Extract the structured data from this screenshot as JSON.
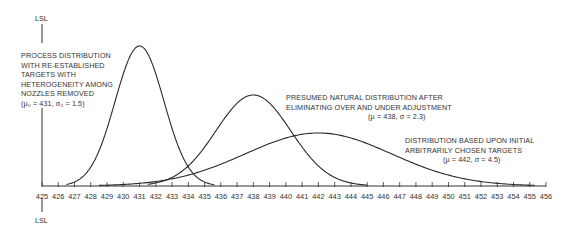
{
  "chart_data": {
    "type": "line",
    "title": "",
    "xlabel": "",
    "ylabel": "",
    "xlim": [
      425,
      456
    ],
    "x_ticks": [
      425,
      426,
      427,
      428,
      429,
      430,
      431,
      432,
      433,
      434,
      435,
      436,
      437,
      438,
      439,
      440,
      441,
      442,
      443,
      444,
      445,
      446,
      447,
      448,
      449,
      450,
      451,
      452,
      453,
      454,
      455,
      456
    ],
    "grid": false,
    "legend": "none (inline annotations)",
    "reference_lines": [
      {
        "name": "LSL",
        "x": 425,
        "label": "LSL"
      }
    ],
    "series": [
      {
        "name": "Process distribution with re-established targets with heterogeneity among nozzles removed",
        "distribution": "normal",
        "mean": 431,
        "sigma": 1.5,
        "param_label": "(μ₀ = 431, σ₀ = 1.5)",
        "x_range": [
          426.5,
          435.6
        ],
        "relative_peak": 1.0
      },
      {
        "name": "Presumed natural distribution after eliminating over and under adjustment",
        "distribution": "normal",
        "mean": 438,
        "sigma": 2.3,
        "param_label": "(μ = 438, σ = 2.3)",
        "x_range": [
          431.5,
          445
        ],
        "relative_peak": 0.65
      },
      {
        "name": "Distribution based upon initial arbitrarily chosen targets",
        "distribution": "normal",
        "mean": 442,
        "sigma": 4.5,
        "param_label": "(μ = 442, σ = 4.5)",
        "x_range": [
          428.5,
          455.3
        ],
        "relative_peak": 0.38
      }
    ],
    "annotations": [
      {
        "lines": [
          "PROCESS DISTRIBUTION",
          "WITH RE-ESTABLISHED",
          "TARGETS WITH",
          "HETEROGENEITY AMONG",
          "NOZZLES REMOVED",
          "(μ₀ = 431, σ₀ = 1.5)"
        ]
      },
      {
        "lines": [
          "PRESUMED NATURAL DISTRIBUTION AFTER",
          "ELIMINATING OVER AND UNDER ADJUSTMENT",
          "(μ = 438, σ = 2.3)"
        ]
      },
      {
        "lines": [
          "DISTRIBUTION BASED UPON INITIAL",
          "ARBITRARILY CHOSEN TARGETS",
          "(μ = 442, σ = 4.5)"
        ]
      }
    ]
  },
  "labels": {
    "lsl_top": "LSL",
    "lsl_bottom": "LSL",
    "a1": {
      "l1": "PROCESS DISTRIBUTION",
      "l2": "WITH RE-ESTABLISHED",
      "l3": "TARGETS WITH",
      "l4": "HETEROGENEITY AMONG",
      "l5": "NOZZLES REMOVED",
      "l6": "(μ₀ = 431, σ₀ = 1.5)"
    },
    "a2": {
      "l1": "PRESUMED NATURAL DISTRIBUTION AFTER",
      "l2": "ELIMINATING OVER AND UNDER ADJUSTMENT",
      "l3": "(μ = 438, σ = 2.3)"
    },
    "a3": {
      "l1": "DISTRIBUTION BASED UPON INITIAL",
      "l2": "ARBITRARILY CHOSEN TARGETS",
      "l3": "(μ = 442, σ = 4.5)"
    }
  }
}
